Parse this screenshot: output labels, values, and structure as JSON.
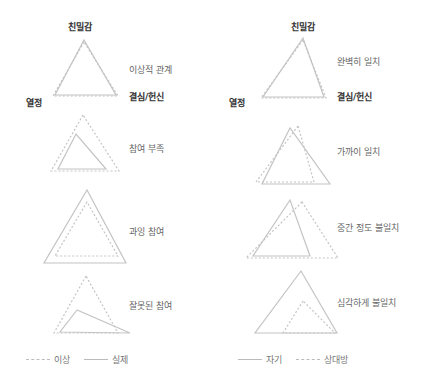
{
  "axes": {
    "intimacy": "친밀감",
    "passion": "열정",
    "commitment": "결심/헌신"
  },
  "left_panel": {
    "cases": [
      {
        "label": "이상적 관계"
      },
      {
        "label": "참여 부족"
      },
      {
        "label": "과잉 참여"
      },
      {
        "label": "잘못된 참여"
      }
    ],
    "legend": {
      "dashed": "이상",
      "solid": "실제"
    }
  },
  "right_panel": {
    "cases": [
      {
        "label": "완벽히 일치"
      },
      {
        "label": "가까이 일치"
      },
      {
        "label": "중간 정도 불일치"
      },
      {
        "label": "심각하게 불일치"
      }
    ],
    "legend": {
      "solid": "자기",
      "dashed": "상대방"
    }
  },
  "colors": {
    "line": "#c0c0c0",
    "axis_text": "#333333",
    "label_text": "#666666"
  }
}
